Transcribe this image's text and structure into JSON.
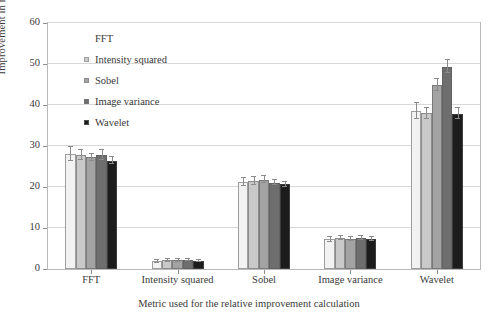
{
  "chart_data": {
    "type": "bar",
    "title": "",
    "xlabel": "Metric used for the relative improvement calculation",
    "ylabel": "Improvement in metric (%)",
    "ylim": [
      0,
      60
    ],
    "yticks": [
      0,
      10,
      20,
      30,
      40,
      50,
      60
    ],
    "grid": true,
    "legend_position": "upper left (inside axes)",
    "legend_title": "FFT",
    "categories": [
      "FFT",
      "Intensity squared",
      "Sobel",
      "Image variance",
      "Wavelet"
    ],
    "series": [
      {
        "name": "FFT",
        "color": "#f2f2f2",
        "values": [
          28.0,
          1.9,
          21.2,
          7.3,
          38.5
        ],
        "errors": [
          1.7,
          0.4,
          0.9,
          0.6,
          1.9
        ]
      },
      {
        "name": "Intensity squared",
        "color": "#c9c9c9",
        "values": [
          27.8,
          2.1,
          21.5,
          7.6,
          38.0
        ],
        "errors": [
          1.2,
          0.3,
          0.9,
          0.5,
          1.3
        ]
      },
      {
        "name": "Sobel",
        "color": "#a3a3a3",
        "values": [
          27.2,
          2.1,
          21.8,
          7.3,
          44.9
        ],
        "errors": [
          0.8,
          0.3,
          0.8,
          0.4,
          1.5
        ]
      },
      {
        "name": "Image variance",
        "color": "#6e6e6e",
        "values": [
          27.8,
          2.2,
          21.1,
          7.6,
          49.3
        ],
        "errors": [
          1.2,
          0.3,
          0.7,
          0.5,
          1.6
        ]
      },
      {
        "name": "Wavelet",
        "color": "#1c1c1c",
        "values": [
          26.4,
          2.0,
          20.7,
          7.3,
          37.9
        ],
        "errors": [
          0.9,
          0.3,
          0.6,
          0.4,
          1.3
        ]
      }
    ]
  },
  "legend": {
    "title": "FFT",
    "entries": [
      {
        "label": "Intensity squared",
        "color": "#c9c9c9"
      },
      {
        "label": "Sobel",
        "color": "#a3a3a3"
      },
      {
        "label": "Image variance",
        "color": "#6e6e6e"
      },
      {
        "label": "Wavelet",
        "color": "#1c1c1c"
      }
    ]
  },
  "axes": {
    "y_label": "Improvement in metric (%)",
    "x_label": "Metric used for the relative improvement calculation",
    "y_ticks": [
      "0",
      "10",
      "20",
      "30",
      "40",
      "50",
      "60"
    ],
    "x_ticks": [
      "FFT",
      "Intensity squared",
      "Sobel",
      "Image variance",
      "Wavelet"
    ]
  }
}
